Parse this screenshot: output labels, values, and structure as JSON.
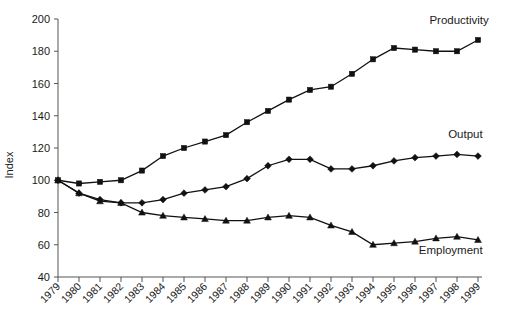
{
  "chart_data": {
    "type": "line",
    "title": "",
    "subtitle": "",
    "xlabel": "",
    "ylabel": "Index",
    "ylim": [
      40,
      200
    ],
    "ytick_values": [
      40,
      60,
      80,
      100,
      120,
      140,
      160,
      180,
      200
    ],
    "ytick_labels": [
      "40",
      "60",
      "80",
      "100",
      "120",
      "140",
      "160",
      "180",
      "200"
    ],
    "grid": false,
    "legend_position": "inline-right-of-series",
    "x": [
      1979,
      1980,
      1981,
      1982,
      1983,
      1984,
      1985,
      1986,
      1987,
      1988,
      1989,
      1990,
      1991,
      1992,
      1993,
      1994,
      1995,
      1996,
      1997,
      1998,
      1999
    ],
    "categories": [
      "1979",
      "1980",
      "1981",
      "1982",
      "1983",
      "1984",
      "1985",
      "1986",
      "1987",
      "1988",
      "1989",
      "1990",
      "1991",
      "1992",
      "1993",
      "1994",
      "1995",
      "1996",
      "1997",
      "1998",
      "1999"
    ],
    "series": [
      {
        "name": "Productivity",
        "marker": "square",
        "color": "#111111",
        "values": [
          100,
          98,
          99,
          100,
          106,
          115,
          120,
          124,
          128,
          136,
          143,
          150,
          156,
          158,
          166,
          175,
          182,
          181,
          180,
          180,
          187
        ]
      },
      {
        "name": "Output",
        "marker": "diamond",
        "color": "#111111",
        "values": [
          100,
          92,
          88,
          86,
          86,
          88,
          92,
          94,
          96,
          101,
          109,
          113,
          113,
          107,
          107,
          109,
          112,
          114,
          115,
          116,
          115
        ]
      },
      {
        "name": "Employment",
        "marker": "triangle",
        "color": "#111111",
        "values": [
          100,
          92,
          87,
          86,
          80,
          78,
          77,
          76,
          75,
          75,
          77,
          78,
          77,
          72,
          68,
          60,
          61,
          62,
          64,
          65,
          63
        ]
      }
    ],
    "annotations": [
      {
        "text": "Productivity",
        "x": 1998.1,
        "y": 197
      },
      {
        "text": "Output",
        "x": 1998.4,
        "y": 126
      },
      {
        "text": "Employment",
        "x": 1997.7,
        "y": 54
      }
    ]
  },
  "axis": {
    "ylabel": "Index"
  }
}
